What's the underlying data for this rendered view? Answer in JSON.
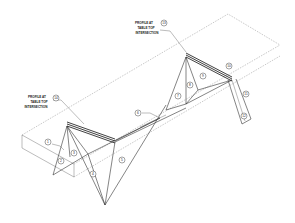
{
  "drawing": {
    "type": "isometric technical drawing",
    "notes": [
      {
        "id": "note-right",
        "lines": [
          "PROFILE AT",
          "TABLE TOP",
          "INTERSECTION"
        ],
        "callout": "13"
      },
      {
        "id": "note-left",
        "lines": [
          "PROFILE AT",
          "TABLE TOP",
          "INTERSECTION"
        ],
        "callout": "14"
      }
    ],
    "callouts": [
      "1",
      "2",
      "3",
      "4",
      "5",
      "6",
      "7",
      "8",
      "9",
      "10",
      "11",
      "12",
      "13",
      "14"
    ],
    "colors": {
      "line": "#333333",
      "background": "#ffffff",
      "profile_bar": "#111111"
    }
  }
}
